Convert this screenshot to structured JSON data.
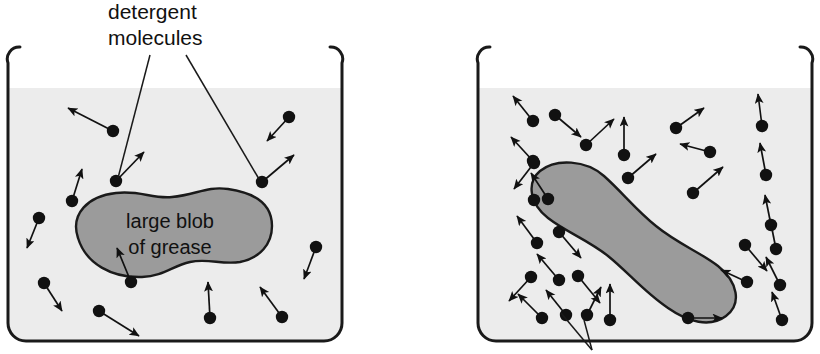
{
  "figure": {
    "background_color": "#ffffff",
    "stroke_color": "#1a1a1a",
    "liquid_color": "#ececec",
    "blob_color": "#9b9b9b",
    "molecule_color": "#111111"
  },
  "annotations": {
    "detergent_label_line1": "detergent",
    "detergent_label_line2": "molecules"
  },
  "panels": [
    {
      "id": "left-panel",
      "name": "beaker-with-large-grease-blob",
      "beaker": {
        "x": 8,
        "y": 45,
        "width": 334,
        "height": 296,
        "liquid_top": 88,
        "corner_radius": 18
      },
      "blob": {
        "label_line1": "large blob",
        "label_line2": "of grease",
        "label_x": 170,
        "label_y1": 228,
        "label_y2": 254,
        "path": "M 78 238 C 70 214 88 196 116 193 C 140 190 152 199 172 197 C 196 195 206 186 228 189 C 256 193 272 205 272 226 C 272 244 260 258 240 262 C 222 265 208 258 190 262 C 172 266 164 276 142 277 C 112 278 86 264 78 238 Z"
      },
      "molecules": [
        {
          "x": 113,
          "y": 131,
          "ax": -45,
          "ay": -23
        },
        {
          "x": 72,
          "y": 201,
          "ax": 10,
          "ay": -32
        },
        {
          "x": 39,
          "y": 218,
          "ax": -12,
          "ay": 30
        },
        {
          "x": 44,
          "y": 283,
          "ax": 18,
          "ay": 28
        },
        {
          "x": 99,
          "y": 311,
          "ax": 40,
          "ay": 25
        },
        {
          "x": 116,
          "y": 181,
          "ax": 28,
          "ay": -29
        },
        {
          "x": 131,
          "y": 282,
          "ax": -14,
          "ay": -34
        },
        {
          "x": 210,
          "y": 318,
          "ax": -2,
          "ay": -36
        },
        {
          "x": 262,
          "y": 182,
          "ax": 32,
          "ay": -27
        },
        {
          "x": 282,
          "y": 317,
          "ax": -22,
          "ay": -30
        },
        {
          "x": 289,
          "y": 117,
          "ax": -22,
          "ay": 24
        },
        {
          "x": 316,
          "y": 247,
          "ax": -12,
          "ay": 32
        }
      ],
      "leader_lines": [
        {
          "x1": 150,
          "y1": 53,
          "x2": 118,
          "y2": 178
        },
        {
          "x1": 186,
          "y1": 53,
          "x2": 259,
          "y2": 179
        }
      ]
    },
    {
      "id": "right-panel",
      "name": "beaker-with-emulsified-grease-blob",
      "beaker": {
        "x": 478,
        "y": 45,
        "width": 334,
        "height": 296,
        "liquid_top": 88,
        "corner_radius": 18
      },
      "blob": {
        "path": "M 540 197 C 556 184 586 186 604 202 C 622 218 636 236 656 252 C 678 270 700 278 718 292 C 738 308 742 330 726 342 C 710 354 688 348 668 334 C 644 318 628 298 608 282 C 588 266 566 258 548 244 C 530 230 526 209 540 197 Z"
      },
      "molecules": [
        {
          "x": 533,
          "y": 121,
          "ax": -20,
          "ay": -25
        },
        {
          "x": 533,
          "y": 161,
          "ax": -22,
          "ay": -24
        },
        {
          "x": 534,
          "y": 163,
          "ax": -20,
          "ay": 26
        },
        {
          "x": 537,
          "y": 243,
          "ax": -20,
          "ay": -27
        },
        {
          "x": 531,
          "y": 277,
          "ax": -22,
          "ay": 24
        },
        {
          "x": 542,
          "y": 318,
          "ax": -24,
          "ay": -24
        },
        {
          "x": 534,
          "y": 200,
          "ax": 0,
          "ay": 0
        },
        {
          "x": 555,
          "y": 115,
          "ax": 26,
          "ay": 22
        },
        {
          "x": 548,
          "y": 199,
          "ax": -17,
          "ay": -26
        },
        {
          "x": 559,
          "y": 280,
          "ax": -22,
          "ay": -26
        },
        {
          "x": 566,
          "y": 315,
          "ax": -20,
          "ay": -25
        },
        {
          "x": 586,
          "y": 145,
          "ax": 28,
          "ay": -26
        },
        {
          "x": 559,
          "y": 232,
          "ax": 22,
          "ay": 26
        },
        {
          "x": 578,
          "y": 276,
          "ax": 22,
          "ay": 27
        },
        {
          "x": 587,
          "y": 315,
          "ax": 14,
          "ay": -28
        },
        {
          "x": 624,
          "y": 155,
          "ax": 0,
          "ay": -38
        },
        {
          "x": 610,
          "y": 320,
          "ax": 0,
          "ay": -36
        },
        {
          "x": 628,
          "y": 178,
          "ax": 28,
          "ay": 24
        },
        {
          "x": 676,
          "y": 128,
          "ax": 28,
          "ay": -20
        },
        {
          "x": 710,
          "y": 152,
          "ax": -30,
          "ay": -8
        },
        {
          "x": 693,
          "y": 193,
          "ax": 30,
          "ay": -26
        },
        {
          "x": 688,
          "y": 318,
          "ax": 34,
          "ay": 0
        },
        {
          "x": 745,
          "y": 245,
          "ax": 22,
          "ay": 26
        },
        {
          "x": 747,
          "y": 282,
          "ax": -26,
          "ay": -12
        },
        {
          "x": 762,
          "y": 126,
          "ax": -4,
          "ay": -32
        },
        {
          "x": 766,
          "y": 175,
          "ax": -6,
          "ay": -32
        },
        {
          "x": 771,
          "y": 225,
          "ax": -6,
          "ay": -30
        },
        {
          "x": 776,
          "y": 249,
          "ax": -6,
          "ay": -30
        },
        {
          "x": 780,
          "y": 285,
          "ax": -14,
          "ay": -28
        },
        {
          "x": 782,
          "y": 320,
          "ax": -10,
          "ay": -28
        }
      ],
      "leader_lines": [
        {
          "x1": 592,
          "y1": 347,
          "x2": 560,
          "y2": 312
        },
        {
          "x1": 592,
          "y1": 347,
          "x2": 582,
          "y2": 318
        }
      ]
    }
  ]
}
